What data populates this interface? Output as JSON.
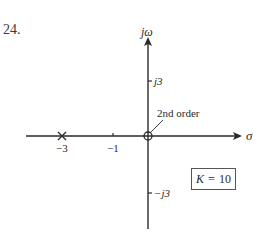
{
  "problem_number": "24.",
  "axes": {
    "imag_label": "jω",
    "real_label": "σ",
    "real_ticks": [
      {
        "value": -3,
        "label": "−3"
      },
      {
        "value": -1,
        "label": "−1"
      }
    ],
    "imag_ticks": [
      {
        "value": 3,
        "label": "j3"
      },
      {
        "value": -3,
        "label": "−j3"
      }
    ]
  },
  "poles": [
    {
      "real": -3,
      "imag": 0,
      "marker": "x",
      "order": 1
    }
  ],
  "zeros": [
    {
      "real": 0,
      "imag": 0,
      "marker": "o",
      "order": 2,
      "annotation": "2nd order"
    }
  ],
  "gain_box": {
    "symbol": "K",
    "equals": "=",
    "value": "10"
  },
  "colors": {
    "ink": "#2a2a2a",
    "background": "#ffffff"
  }
}
